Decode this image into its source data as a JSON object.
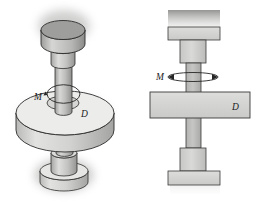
{
  "figure": {
    "name": "shaft-disk-torque-figure",
    "background_color": "#ffffff",
    "views": [
      {
        "id": "isometric-view",
        "title": "Isometric pictorial view of stepped shaft with disk",
        "labels": [
          {
            "text": "M",
            "meaning": "applied torque / twisting moment"
          },
          {
            "text": "D",
            "meaning": "disk diameter"
          }
        ]
      },
      {
        "id": "elevation-view",
        "title": "Front elevation view of stepped shaft with disk",
        "labels": [
          {
            "text": "M",
            "meaning": "applied torque / twisting moment"
          },
          {
            "text": "D",
            "meaning": "disk diameter"
          }
        ]
      }
    ],
    "labels": {
      "moment_left": "M",
      "diameter_left": "D",
      "moment_right": "M",
      "diameter_right": "D"
    },
    "colors": {
      "face_light": "#e4e4e2",
      "face_mid": "#cfcfcd",
      "face_dark": "#b4b4b2",
      "face_darker": "#9b9b99",
      "outline": "#2a2a2a",
      "shadow": "#b9b9b7",
      "label_color": "#1a1a1a",
      "background": "#ffffff"
    }
  }
}
